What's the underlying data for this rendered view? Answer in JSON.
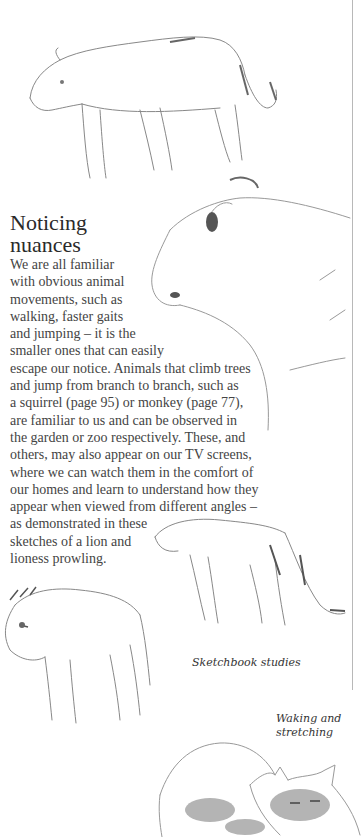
{
  "article": {
    "title_line1": "Noticing",
    "title_line2": "nuances",
    "body_lines": [
      "We are all familiar",
      "with obvious animal",
      "movements, such as",
      "walking, faster gaits",
      "and jumping – it is the",
      "smaller ones that can easily",
      "escape our notice. Animals that climb trees",
      "and jump from branch to branch, such as",
      "a squirrel (page 95) or monkey (page 77),",
      "are familiar to us and can be observed in",
      "the garden or zoo respectively. These, and",
      "others, may also appear on our TV screens,",
      "where we can watch them in the comfort of",
      "our homes and learn to understand how they",
      "appear when viewed from different angles –",
      "as demonstrated in these",
      "sketches of a lion and",
      "lioness prowling."
    ]
  },
  "captions": {
    "sketchbook": "Sketchbook studies",
    "waking_line1": "Waking and",
    "waking_line2": "stretching"
  },
  "illustrations": [
    "lioness-walking-sketch",
    "lioness-head-sketch",
    "lioness-prowling-sketch",
    "lion-sketch",
    "cat-stretching-sketch"
  ]
}
